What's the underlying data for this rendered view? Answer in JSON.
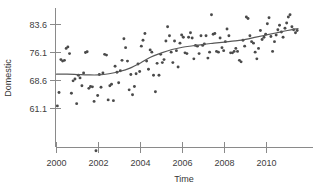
{
  "chart_data": {
    "type": "scatter",
    "title": "",
    "xlabel": "Time",
    "ylabel": "Domestic",
    "xlim": [
      1999.6,
      2011.8
    ],
    "ylim": [
      47.0,
      88.0
    ],
    "grid": false,
    "legend": null,
    "xticks": [
      2000,
      2002,
      2004,
      2006,
      2008,
      2010
    ],
    "xtick_labels": [
      "2000",
      "2002",
      "2004",
      "2006",
      "2008",
      "2010"
    ],
    "yticks": [
      61.1,
      68.6,
      76.1,
      83.6
    ],
    "ytick_labels": [
      "61.1",
      "68.6",
      "76.1",
      "83.6"
    ],
    "series": [
      {
        "name": "Domestic",
        "type": "scatter",
        "marker": "circle",
        "color": "#4a4a4a",
        "x": [
          2000.04,
          2000.12,
          2000.21,
          2000.29,
          2000.38,
          2000.46,
          2000.54,
          2000.62,
          2000.71,
          2000.79,
          2000.88,
          2000.96,
          2001.04,
          2001.12,
          2001.21,
          2001.29,
          2001.38,
          2001.46,
          2001.54,
          2001.62,
          2001.71,
          2001.79,
          2001.88,
          2001.96,
          2002.04,
          2002.12,
          2002.21,
          2002.29,
          2002.38,
          2002.46,
          2002.54,
          2002.62,
          2002.71,
          2002.79,
          2002.88,
          2002.96,
          2003.04,
          2003.12,
          2003.21,
          2003.29,
          2003.38,
          2003.46,
          2003.54,
          2003.62,
          2003.71,
          2003.79,
          2003.88,
          2003.96,
          2004.04,
          2004.12,
          2004.21,
          2004.29,
          2004.38,
          2004.46,
          2004.54,
          2004.62,
          2004.71,
          2004.79,
          2004.88,
          2004.96,
          2005.04,
          2005.12,
          2005.21,
          2005.29,
          2005.38,
          2005.46,
          2005.54,
          2005.62,
          2005.71,
          2005.79,
          2005.88,
          2005.96,
          2006.04,
          2006.12,
          2006.21,
          2006.29,
          2006.38,
          2006.46,
          2006.54,
          2006.62,
          2006.71,
          2006.79,
          2006.88,
          2006.96,
          2007.04,
          2007.12,
          2007.21,
          2007.29,
          2007.38,
          2007.46,
          2007.54,
          2007.62,
          2007.71,
          2007.79,
          2007.88,
          2007.96,
          2008.04,
          2008.12,
          2008.21,
          2008.29,
          2008.38,
          2008.46,
          2008.54,
          2008.62,
          2008.71,
          2008.79,
          2008.88,
          2008.96,
          2009.04,
          2009.12,
          2009.21,
          2009.29,
          2009.38,
          2009.46,
          2009.54,
          2009.62,
          2009.71,
          2009.79,
          2009.88,
          2009.96,
          2010.04,
          2010.12,
          2010.21,
          2010.29,
          2010.38,
          2010.46,
          2010.54,
          2010.62,
          2010.71,
          2010.79,
          2010.88,
          2010.96,
          2011.04,
          2011.12,
          2011.21,
          2011.29,
          2011.38,
          2011.46
        ],
        "y": [
          61.8,
          65.4,
          74.2,
          73.8,
          74.0,
          77.2,
          77.6,
          75.8,
          65.2,
          68.5,
          69.0,
          62.4,
          70.0,
          69.3,
          67.2,
          70.6,
          76.1,
          76.3,
          66.5,
          67.0,
          66.9,
          63.0,
          49.8,
          64.6,
          70.2,
          66.8,
          70.6,
          75.6,
          75.4,
          63.4,
          67.2,
          67.6,
          63.2,
          72.4,
          70.8,
          68.0,
          71.2,
          74.0,
          79.8,
          77.4,
          73.8,
          66.1,
          70.2,
          64.8,
          67.0,
          70.4,
          73.0,
          71.0,
          77.8,
          79.4,
          81.2,
          73.8,
          71.6,
          76.8,
          76.2,
          70.0,
          65.6,
          73.2,
          70.0,
          75.6,
          73.4,
          74.2,
          79.2,
          83.0,
          80.6,
          76.2,
          73.4,
          79.2,
          76.6,
          72.2,
          78.6,
          80.8,
          80.2,
          76.0,
          75.8,
          80.2,
          81.4,
          80.0,
          74.4,
          78.0,
          77.8,
          75.8,
          80.6,
          78.0,
          78.4,
          80.6,
          74.6,
          76.2,
          86.2,
          81.0,
          81.2,
          76.4,
          76.2,
          80.0,
          77.4,
          76.6,
          79.0,
          82.4,
          80.6,
          76.0,
          76.0,
          76.4,
          77.2,
          76.4,
          74.0,
          73.6,
          79.4,
          77.8,
          85.6,
          85.2,
          80.6,
          79.0,
          78.6,
          76.2,
          74.4,
          77.2,
          82.0,
          79.6,
          80.2,
          81.0,
          83.8,
          85.4,
          80.4,
          76.4,
          79.0,
          80.8,
          82.2,
          83.4,
          81.6,
          80.2,
          82.6,
          84.0,
          85.6,
          86.2,
          83.0,
          82.2,
          81.4,
          82.0
        ]
      },
      {
        "name": "Trend (smooth)",
        "type": "line",
        "color": "#585858",
        "x": [
          2000.0,
          2000.5,
          2001.0,
          2001.5,
          2002.0,
          2002.5,
          2003.0,
          2003.5,
          2004.0,
          2004.5,
          2005.0,
          2005.5,
          2006.0,
          2006.5,
          2007.0,
          2007.5,
          2008.0,
          2008.5,
          2009.0,
          2009.5,
          2010.0,
          2010.5,
          2011.0,
          2011.5
        ],
        "y": [
          70.3,
          70.3,
          70.2,
          70.1,
          70.1,
          70.4,
          71.0,
          71.9,
          73.3,
          74.9,
          76.0,
          76.9,
          77.5,
          77.9,
          78.3,
          78.6,
          78.9,
          79.2,
          79.6,
          80.2,
          80.8,
          81.4,
          82.0,
          82.5
        ]
      }
    ]
  },
  "axes": {
    "ylabel": "Domestic",
    "xlabel": "Time"
  }
}
